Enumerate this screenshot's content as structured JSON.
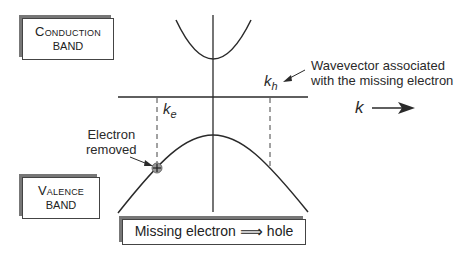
{
  "diagram": {
    "boxes": {
      "conduction": {
        "line1": "Conduction",
        "line2": "band"
      },
      "valence": {
        "line1": "Valence",
        "line2": "band"
      },
      "summary": {
        "left": "Missing electron",
        "arrow": "⟹",
        "right": "hole"
      }
    },
    "labels": {
      "ke_main": "k",
      "ke_sub": "e",
      "kh_main": "k",
      "kh_sub": "h",
      "k_axis": "k",
      "electron_removed_line1": "Electron",
      "electron_removed_line2": "removed",
      "wavevector_line1": "Wavevector associated",
      "wavevector_line2": "with the missing electron"
    },
    "colors": {
      "line": "#2a2a2a",
      "shadow": "#777777",
      "hole_fill": "#9a9a9a"
    }
  }
}
